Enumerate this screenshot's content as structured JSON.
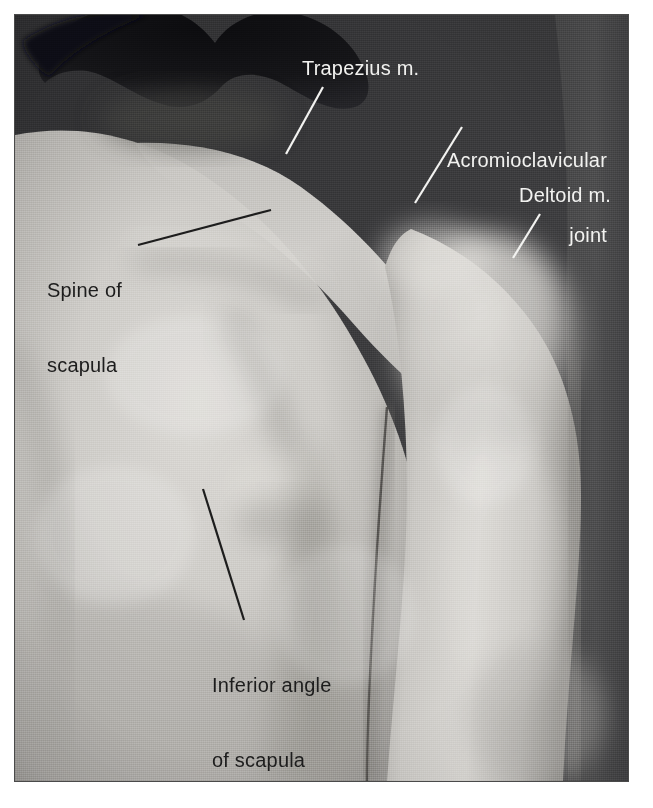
{
  "figure": {
    "kind": "surface-anatomy-photograph",
    "region": "posterior shoulder and back",
    "view": "posterior",
    "border_color": "#4a4a4a",
    "page_background": "#ffffff"
  },
  "photo": {
    "background_tone_dark": "#3a3a3a",
    "background_tone_mid": "#4e4e4e",
    "skin_tone_light": "#d8d6d2",
    "skin_tone_mid": "#b9b7b3",
    "skin_tone_shadow": "#8f8d8a",
    "hair_tone": "#16161a"
  },
  "labels": [
    {
      "id": "trapezius",
      "text": "Trapezius m.",
      "lines": [
        "Trapezius m."
      ],
      "color": "#f2f2f0",
      "style": "light",
      "align": "left",
      "text_x": 302,
      "text_y": 56,
      "leader": {
        "x1": 322,
        "y1": 86,
        "x2": 285,
        "y2": 153,
        "color": "#f2f2f0",
        "width": 2
      }
    },
    {
      "id": "acromioclavicular-joint",
      "text": "Acromioclavicular joint",
      "lines": [
        "Acromioclavicular",
        "joint"
      ],
      "color": "#f2f2f0",
      "style": "light",
      "align": "right",
      "text_x": 411,
      "text_y": 98,
      "leader": {
        "x1": 461,
        "y1": 126,
        "x2": 414,
        "y2": 202,
        "color": "#f2f2f0",
        "width": 2
      }
    },
    {
      "id": "deltoid",
      "text": "Deltoid m.",
      "lines": [
        "Deltoid m."
      ],
      "color": "#f2f2f0",
      "style": "light",
      "align": "left",
      "text_x": 519,
      "text_y": 183,
      "leader": {
        "x1": 539,
        "y1": 213,
        "x2": 512,
        "y2": 257,
        "color": "#f2f2f0",
        "width": 2
      }
    },
    {
      "id": "spine-of-scapula",
      "text": "Spine of scapula",
      "lines": [
        "Spine of",
        "scapula"
      ],
      "color": "#1d1d1d",
      "style": "dark",
      "align": "left",
      "text_x": 47,
      "text_y": 228,
      "leader": {
        "x1": 137,
        "y1": 244,
        "x2": 270,
        "y2": 209,
        "color": "#1d1d1d",
        "width": 2
      }
    },
    {
      "id": "inferior-angle-of-scapula",
      "text": "Inferior angle of scapula",
      "lines": [
        "Inferior angle",
        "of scapula"
      ],
      "color": "#1d1d1d",
      "style": "dark",
      "align": "left",
      "text_x": 212,
      "text_y": 623,
      "leader": {
        "x1": 202,
        "y1": 488,
        "x2": 243,
        "y2": 619,
        "color": "#1d1d1d",
        "width": 2
      }
    }
  ]
}
